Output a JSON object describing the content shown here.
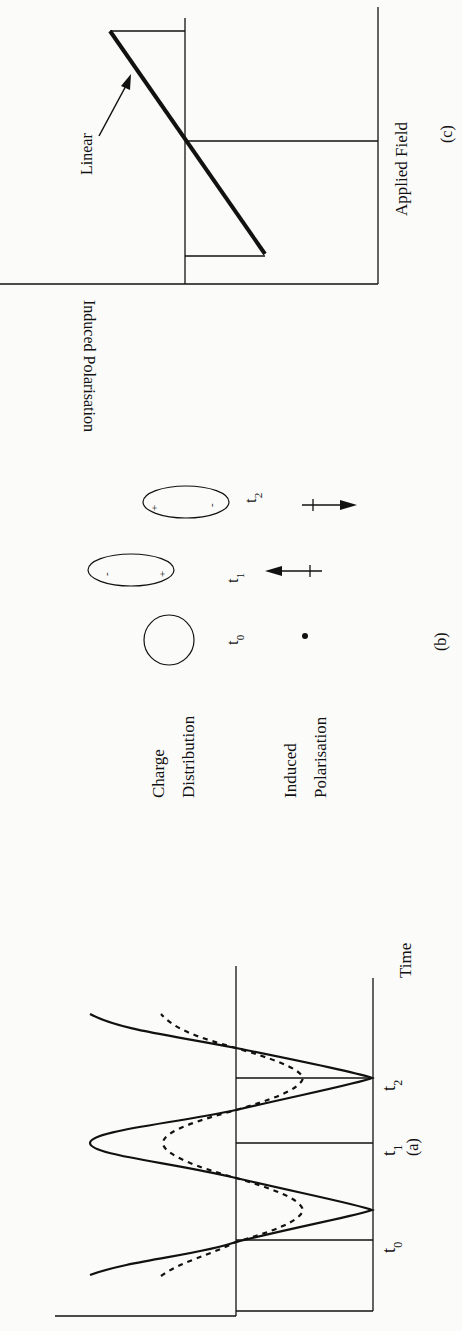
{
  "figure": {
    "panels": [
      {
        "id": "c",
        "caption": "(c)",
        "x_axis_label": "Applied Field",
        "y_axis_label": "Induced Polarisation",
        "annotation": "Linear",
        "description": "Linear relationship between applied field and induced polarisation"
      },
      {
        "id": "b",
        "caption": "(b)",
        "row_labels": [
          "Charge Distribution",
          "Induced Polarisation"
        ],
        "row_label_lines": [
          [
            "Charge",
            "Distribution"
          ],
          [
            "Induced",
            "Polarisation"
          ]
        ],
        "states": [
          {
            "time": "t",
            "sub": "0",
            "charge": "none",
            "polarisation": "dot"
          },
          {
            "time": "t",
            "sub": "1",
            "charge_left": "-",
            "charge_right": "+",
            "polarisation": "arrow-left"
          },
          {
            "time": "t",
            "sub": "2",
            "charge_left": "+",
            "charge_right": "-",
            "polarisation": "arrow-right"
          }
        ]
      },
      {
        "id": "a",
        "caption": "(a)",
        "x_axis_label": "Time",
        "time_markers": [
          {
            "label": "t",
            "sub": "0"
          },
          {
            "label": "t",
            "sub": "1"
          },
          {
            "label": "t",
            "sub": "2"
          }
        ],
        "series": [
          {
            "name": "applied field",
            "style": "solid"
          },
          {
            "name": "induced polarisation",
            "style": "dotted"
          }
        ]
      }
    ]
  }
}
